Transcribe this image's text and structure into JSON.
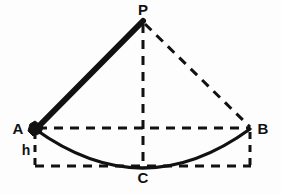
{
  "figure": {
    "type": "geometry-diagram",
    "background_color": "#fdfdfd",
    "stroke_color": "#111111"
  },
  "labels": {
    "pivot": "P",
    "left_extreme": "A",
    "right_extreme": "B",
    "lowest_point": "C",
    "height": "h"
  },
  "points": {
    "P": {
      "x": 143,
      "y": 21
    },
    "A": {
      "x": 35,
      "y": 128
    },
    "B": {
      "x": 250,
      "y": 128
    },
    "C": {
      "x": 143,
      "y": 166
    }
  },
  "label_positions": {
    "P": {
      "x": 143,
      "y": 15
    },
    "A": {
      "x": 18,
      "y": 134
    },
    "B": {
      "x": 262,
      "y": 134
    },
    "C": {
      "x": 143,
      "y": 182
    },
    "h": {
      "x": 26,
      "y": 154
    }
  },
  "elements": {
    "string": {
      "name": "pendulum-string-PA",
      "style": "solid-thick",
      "width": 6,
      "from": "P",
      "to": "A"
    },
    "string_dashed": {
      "name": "pendulum-string-PB",
      "style": "dashed",
      "width": 3,
      "from": "P",
      "to": "B"
    },
    "vertical_axis": {
      "name": "vertical-axis-PC",
      "style": "dashed",
      "width": 3,
      "from": "P",
      "to": "C"
    },
    "chord_AB": {
      "name": "chord-AB",
      "style": "dashed",
      "width": 3,
      "from": "A",
      "to": "B"
    },
    "arc_ACB": {
      "name": "swing-arc-ACB",
      "style": "solid",
      "width": 3,
      "from": "A",
      "through": "C",
      "to": "B"
    },
    "height_left": {
      "name": "height-line-left",
      "style": "dashed",
      "width": 3,
      "from": {
        "x": 35,
        "y": 128
      },
      "to": {
        "x": 35,
        "y": 166
      }
    },
    "height_right": {
      "name": "height-line-right",
      "style": "dashed",
      "width": 3,
      "from": {
        "x": 250,
        "y": 128
      },
      "to": {
        "x": 250,
        "y": 166
      }
    },
    "baseline": {
      "name": "baseline-dashed",
      "style": "dashed",
      "width": 3,
      "from": {
        "x": 35,
        "y": 166
      },
      "to": {
        "x": 250,
        "y": 166
      }
    },
    "bob": {
      "name": "pendulum-bob",
      "shape": "filled-blob",
      "center": {
        "x": 35,
        "y": 128
      },
      "radius": 6
    }
  }
}
